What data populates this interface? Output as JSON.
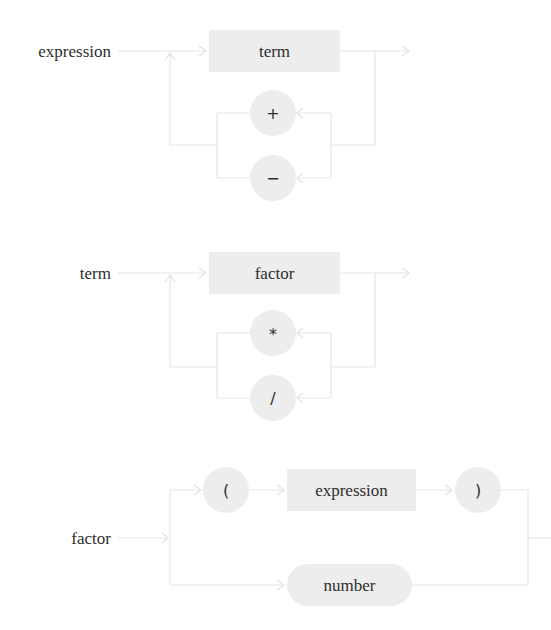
{
  "diagram": {
    "type": "railroad-syntax-diagram",
    "colors": {
      "rail": "#e6e6e6",
      "node_fill": "#ededed",
      "text": "#2e2e2e",
      "background": "#ffffff"
    },
    "rules": [
      {
        "name": "expression",
        "label": "expression",
        "sequence": [
          {
            "kind": "nonterminal",
            "label": "term"
          }
        ],
        "repeat_operators": [
          {
            "kind": "terminal",
            "label": "+"
          },
          {
            "kind": "terminal",
            "label": "−"
          }
        ]
      },
      {
        "name": "term",
        "label": "term",
        "sequence": [
          {
            "kind": "nonterminal",
            "label": "factor"
          }
        ],
        "repeat_operators": [
          {
            "kind": "terminal",
            "label": "*"
          },
          {
            "kind": "terminal",
            "label": "/"
          }
        ]
      },
      {
        "name": "factor",
        "label": "factor",
        "alternatives": [
          [
            {
              "kind": "terminal",
              "label": "("
            },
            {
              "kind": "nonterminal",
              "label": "expression"
            },
            {
              "kind": "terminal",
              "label": ")"
            }
          ],
          [
            {
              "kind": "terminal",
              "label": "number"
            }
          ]
        ]
      }
    ]
  }
}
